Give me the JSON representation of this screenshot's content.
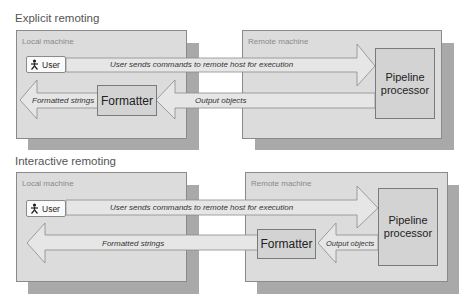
{
  "sections": [
    {
      "title": "Explicit remoting",
      "local_label": "Local machine",
      "remote_label": "Remote machine",
      "user_label": "User",
      "command_arrow_label": "User sends commands to remote host for execution",
      "pipeline_label_line1": "Pipeline",
      "pipeline_label_line2": "processor",
      "output_arrow_label": "Output objects",
      "formatter_label": "Formatter",
      "formatted_arrow_label": "Formatted strings",
      "formatter_location": "Local machine"
    },
    {
      "title": "Interactive remoting",
      "local_label": "Local machine",
      "remote_label": "Remote machine",
      "user_label": "User",
      "command_arrow_label": "User sends commands to remote host for execution",
      "pipeline_label_line1": "Pipeline",
      "pipeline_label_line2": "processor",
      "output_arrow_label": "Output objects",
      "formatter_label": "Formatter",
      "formatted_arrow_label": "Formatted strings",
      "formatter_location": "Remote machine"
    }
  ],
  "colors": {
    "machine_fill": "#dcdcdc",
    "shadow": "#a9a9a9",
    "box_fill": "#d3d3d3",
    "arrow_fill": "#e6e6e6",
    "border": "#8a8a8a"
  }
}
